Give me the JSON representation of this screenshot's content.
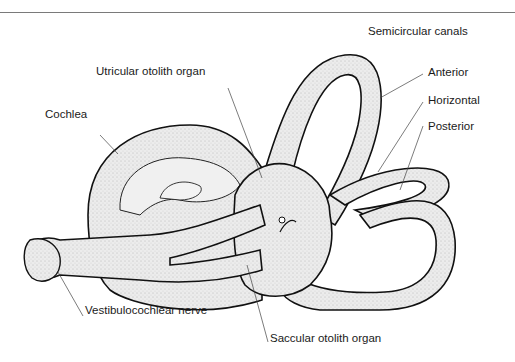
{
  "figure": {
    "title": "Semicircular canals",
    "labels": {
      "semicircular_canals": "Semicircular canals",
      "anterior": "Anterior",
      "horizontal": "Horizontal",
      "posterior": "Posterior",
      "utricular": "Utricular otolith organ",
      "cochlea": "Cochlea",
      "vestibulocochlear": "Vestibulocochlear nerve",
      "saccular": "Saccular otolith organ"
    },
    "colors": {
      "fill": "#e9e9e9",
      "stroke": "#111111",
      "leader": "#444444"
    }
  }
}
